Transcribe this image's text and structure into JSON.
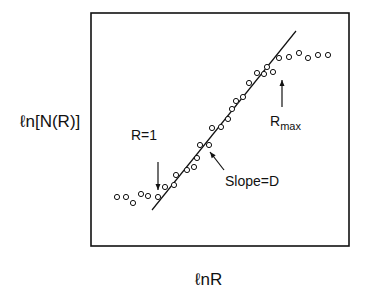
{
  "chart_data": {
    "type": "scatter",
    "title": "",
    "xlabel": "lnR",
    "ylabel": "ln[N(R)]",
    "grid": false,
    "legend": null,
    "axis_ticks": "none",
    "box_px": {
      "x": 91,
      "y": 13,
      "w": 258,
      "h": 233
    },
    "points_px": [
      [
        117,
        197
      ],
      [
        126,
        197
      ],
      [
        133,
        203
      ],
      [
        141,
        194
      ],
      [
        148,
        196
      ],
      [
        158,
        197
      ],
      [
        165,
        187
      ],
      [
        174,
        185
      ],
      [
        176,
        175
      ],
      [
        187,
        170
      ],
      [
        194,
        167
      ],
      [
        197,
        158
      ],
      [
        200,
        145
      ],
      [
        209,
        145
      ],
      [
        212,
        128
      ],
      [
        221,
        127
      ],
      [
        228,
        119
      ],
      [
        232,
        109
      ],
      [
        236,
        101
      ],
      [
        243,
        97
      ],
      [
        249,
        83
      ],
      [
        257,
        73
      ],
      [
        264,
        74
      ],
      [
        267,
        67
      ],
      [
        273,
        72
      ],
      [
        279,
        58
      ],
      [
        289,
        57
      ],
      [
        299,
        53
      ],
      [
        308,
        58
      ],
      [
        318,
        55
      ],
      [
        328,
        55
      ]
    ],
    "fit_line_px": [
      [
        152,
        210
      ],
      [
        296,
        31
      ]
    ],
    "annotations": [
      {
        "text": "R=1",
        "x": 131,
        "y": 139,
        "arrow": [
          [
            158,
            162
          ],
          [
            158,
            190
          ]
        ]
      },
      {
        "text": "Slope=D",
        "x": 225,
        "y": 174,
        "arrow": [
          [
            224,
            170
          ],
          [
            210,
            152
          ]
        ]
      },
      {
        "text": "R",
        "sub": "max",
        "x": 270,
        "y": 110,
        "arrow": [
          [
            282,
            107
          ],
          [
            282,
            80
          ]
        ]
      }
    ]
  },
  "labels": {
    "ylabel_prefix": "ℓn",
    "ylabel_body": "[N(R)]",
    "xlabel": "ℓnR",
    "r1": "R=1",
    "slope": "Slope=D",
    "rmax": "R",
    "rmax_sub": "max"
  }
}
